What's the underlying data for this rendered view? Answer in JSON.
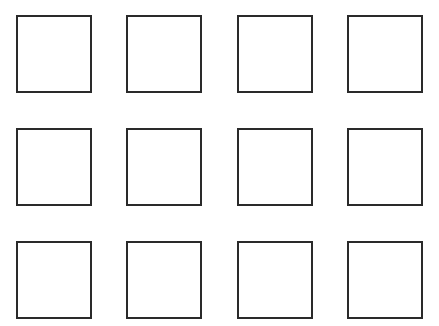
{
  "diagram": {
    "rows": 3,
    "columns": 4,
    "square_width": 76,
    "square_height": 78,
    "border_width": 2,
    "colors": {
      "background": "#ffffff",
      "square_border": "#2a2a2a",
      "square_fill": "#ffffff"
    },
    "column_x": [
      16,
      126,
      237,
      347
    ],
    "row_y": [
      15,
      128,
      241
    ],
    "squares": [
      {
        "row": 0,
        "col": 0,
        "label": ""
      },
      {
        "row": 0,
        "col": 1,
        "label": ""
      },
      {
        "row": 0,
        "col": 2,
        "label": ""
      },
      {
        "row": 0,
        "col": 3,
        "label": ""
      },
      {
        "row": 1,
        "col": 0,
        "label": ""
      },
      {
        "row": 1,
        "col": 1,
        "label": ""
      },
      {
        "row": 1,
        "col": 2,
        "label": ""
      },
      {
        "row": 1,
        "col": 3,
        "label": ""
      },
      {
        "row": 2,
        "col": 0,
        "label": ""
      },
      {
        "row": 2,
        "col": 1,
        "label": ""
      },
      {
        "row": 2,
        "col": 2,
        "label": ""
      },
      {
        "row": 2,
        "col": 3,
        "label": ""
      }
    ]
  }
}
